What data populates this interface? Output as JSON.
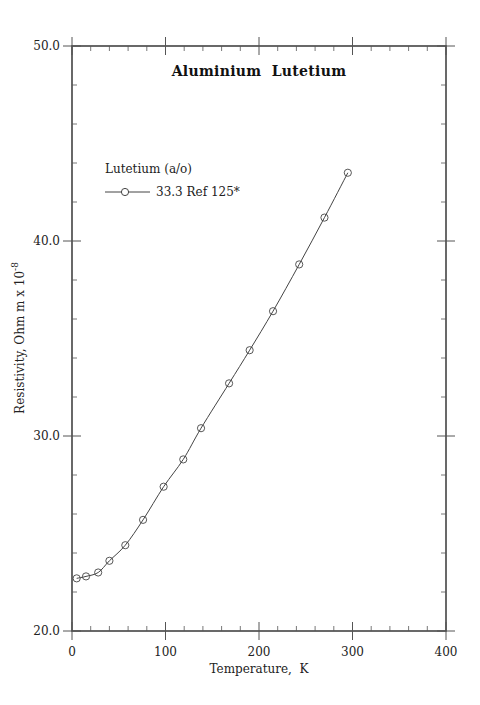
{
  "chart_data": {
    "type": "line",
    "title": "Aluminium  Lutetium",
    "xlabel": "Temperature,  K",
    "ylabel": "Resistivity, Ohm m x 10",
    "ylabel_superscript": "-8",
    "xlim": [
      0,
      400
    ],
    "ylim": [
      20,
      50
    ],
    "xticks": [
      0,
      100,
      200,
      300,
      400
    ],
    "xtick_labels": [
      "0",
      "100",
      "200",
      "300",
      "400"
    ],
    "yticks": [
      20,
      30,
      40,
      50
    ],
    "ytick_labels": [
      "20.0",
      "30.0",
      "40.0",
      "50.0"
    ],
    "x_minor_step": 20,
    "y_minor_step": 2,
    "grid": false,
    "legend_title": "Lutetium (a/o)",
    "legend_position": "upper-left",
    "series": [
      {
        "name": "33.3 Ref 125*",
        "marker": "open-circle",
        "color": "#444444",
        "x": [
          5,
          15,
          28,
          40,
          57,
          76,
          98,
          119,
          138,
          168,
          190,
          215,
          243,
          270,
          295
        ],
        "y": [
          22.7,
          22.8,
          23.0,
          23.6,
          24.4,
          25.7,
          27.4,
          28.8,
          30.4,
          32.7,
          34.4,
          36.4,
          38.8,
          41.2,
          43.5
        ]
      }
    ]
  }
}
